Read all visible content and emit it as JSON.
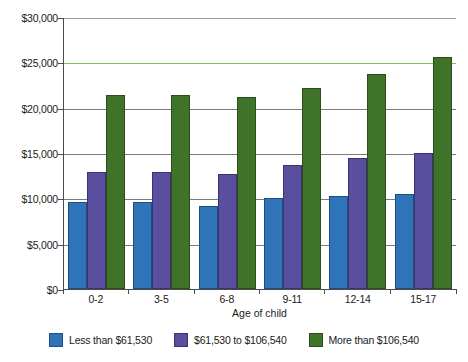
{
  "chart_data": {
    "type": "bar",
    "title": "",
    "xlabel": "Age of child",
    "ylabel": "",
    "categories": [
      "0-2",
      "3-5",
      "6-8",
      "9-11",
      "12-14",
      "15-17"
    ],
    "series": [
      {
        "name": "Less than $61,530",
        "color": "#2f74b8",
        "values": [
          9600,
          9550,
          9200,
          10000,
          10300,
          10500
        ]
      },
      {
        "name": "$61,530 to $106,540",
        "color": "#5a4f9f",
        "values": [
          12950,
          12950,
          12700,
          13650,
          14450,
          14950
        ]
      },
      {
        "name": "More than $106,540",
        "color": "#3f7329",
        "values": [
          21450,
          21450,
          21200,
          22200,
          23700,
          25600
        ]
      }
    ],
    "ylim": [
      0,
      30000
    ],
    "yticks": [
      "$0",
      "$5,000",
      "$10,000",
      "$15,000",
      "$20,000",
      "$25,000",
      "$30,000"
    ],
    "ytick_values": [
      0,
      5000,
      10000,
      15000,
      20000,
      25000,
      30000
    ],
    "grid": true,
    "legend_position": "bottom"
  },
  "legend": {
    "items": [
      {
        "label": "Less than $61,530"
      },
      {
        "label": "$61,530 to $106,540"
      },
      {
        "label": "More than $106,540"
      }
    ]
  },
  "axis": {
    "x_title": "Age of child"
  }
}
